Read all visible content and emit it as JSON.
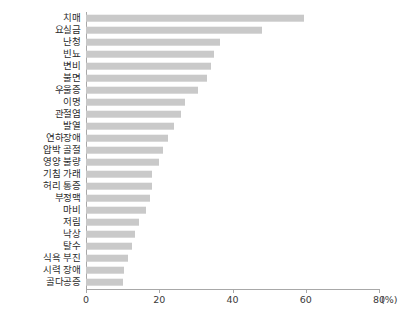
{
  "chart_data": {
    "type": "bar",
    "orientation": "horizontal",
    "title": "",
    "xlabel": "(%)",
    "ylabel": "",
    "xlim": [
      0,
      80
    ],
    "xticks": [
      0,
      20,
      40,
      60,
      80
    ],
    "xtick_labels": [
      "0",
      "20",
      "40",
      "60",
      "80"
    ],
    "unit_label": "(%)",
    "grid": false,
    "legend": null,
    "bar_color": "#c9c9c9",
    "axis_color": "#a8a8a8",
    "categories": [
      "치매",
      "요실금",
      "난청",
      "빈뇨",
      "변비",
      "불면",
      "우울증",
      "이명",
      "관절염",
      "발열",
      "연하장애",
      "압박 골절",
      "영양 불량",
      "기침 가래",
      "허리 통증",
      "부정맥",
      "마비",
      "저림",
      "낙상",
      "탈수",
      "식욕 부진",
      "시력 장애",
      "골다공증"
    ],
    "values": [
      59.5,
      48.0,
      36.5,
      35.0,
      34.0,
      33.0,
      30.5,
      27.0,
      26.0,
      24.0,
      22.5,
      21.0,
      20.0,
      18.0,
      18.0,
      17.5,
      16.5,
      14.5,
      13.5,
      12.5,
      11.5,
      10.5,
      10.0
    ]
  }
}
